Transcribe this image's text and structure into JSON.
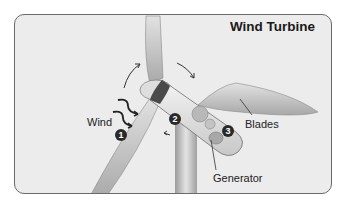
{
  "diagram": {
    "title": "Wind Turbine",
    "labels": {
      "wind": "Wind",
      "blades": "Blades",
      "generator": "Generator"
    },
    "steps": [
      {
        "number": "1",
        "meaning": "wind pushes blades"
      },
      {
        "number": "2",
        "meaning": "rotor turns shaft"
      },
      {
        "number": "3",
        "meaning": "generator produces electricity"
      }
    ],
    "colors": {
      "background": "#ececec",
      "border": "#6a6a6a",
      "badge": "#2a2a2a",
      "blade": "#d4d4d4"
    }
  }
}
